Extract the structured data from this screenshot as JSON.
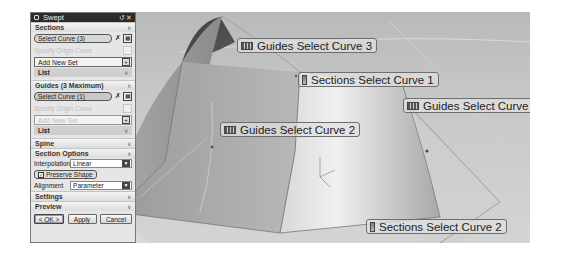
{
  "dialog": {
    "title": "Swept",
    "title_buttons": [
      "reset",
      "close"
    ],
    "sections": {
      "header": "Sections",
      "select_curve": "Select Curve (3)",
      "specify_origin": "Specify Origin Curve",
      "add_new_set": "Add New Set",
      "list": "List"
    },
    "guides": {
      "header": "Guides (3 Maximum)",
      "select_curve": "Select Curve (1)",
      "specify_origin": "Specify Origin Curve",
      "add_new_set": "Add New Set",
      "list": "List"
    },
    "spine": {
      "header": "Spine"
    },
    "section_options": {
      "header": "Section Options",
      "interpolation_label": "Interpolation",
      "interpolation_value": "Linear",
      "preserve_shape_label": "Preserve Shape",
      "preserve_shape_checked": true,
      "alignment_label": "Alignment",
      "alignment_value": "Parameter"
    },
    "settings": {
      "header": "Settings"
    },
    "preview": {
      "header": "Preview"
    },
    "buttons": {
      "ok": "< OK >",
      "apply": "Apply",
      "cancel": "Cancel"
    }
  },
  "viewport": {
    "labels": [
      {
        "text": "Guides Select Curve 3",
        "kind": "guide"
      },
      {
        "text": "Sections Select Curve 1",
        "kind": "section"
      },
      {
        "text": "Guides Select Curve 1",
        "kind": "guide"
      },
      {
        "text": "Guides Select Curve 2",
        "kind": "guide"
      },
      {
        "text": "Sections Select Curve 2",
        "kind": "section"
      }
    ]
  },
  "colors": {
    "titlebar": "#2b2b2b",
    "viewport_bg": "#c8c8c8",
    "surface_dark": "#8d8d8d",
    "surface_light": "#e8e8e8"
  }
}
